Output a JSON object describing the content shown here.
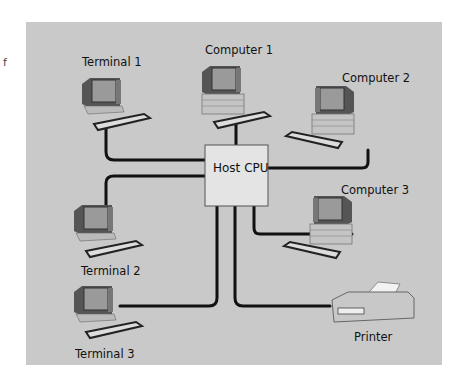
{
  "edge_fragment": "f",
  "diagram": {
    "hub": {
      "label": "Host CPU"
    },
    "nodes": [
      {
        "id": "terminal1",
        "label": "Terminal 1",
        "type": "terminal"
      },
      {
        "id": "computer1",
        "label": "Computer 1",
        "type": "computer"
      },
      {
        "id": "computer2",
        "label": "Computer 2",
        "type": "computer"
      },
      {
        "id": "terminal2",
        "label": "Terminal 2",
        "type": "terminal"
      },
      {
        "id": "computer3",
        "label": "Computer 3",
        "type": "computer"
      },
      {
        "id": "terminal3",
        "label": "Terminal 3",
        "type": "terminal"
      },
      {
        "id": "printer",
        "label": "Printer",
        "type": "printer"
      }
    ],
    "colors": {
      "background": "#c9c9c9",
      "hub_fill": "#e4e4e4",
      "line": "#111111"
    }
  }
}
